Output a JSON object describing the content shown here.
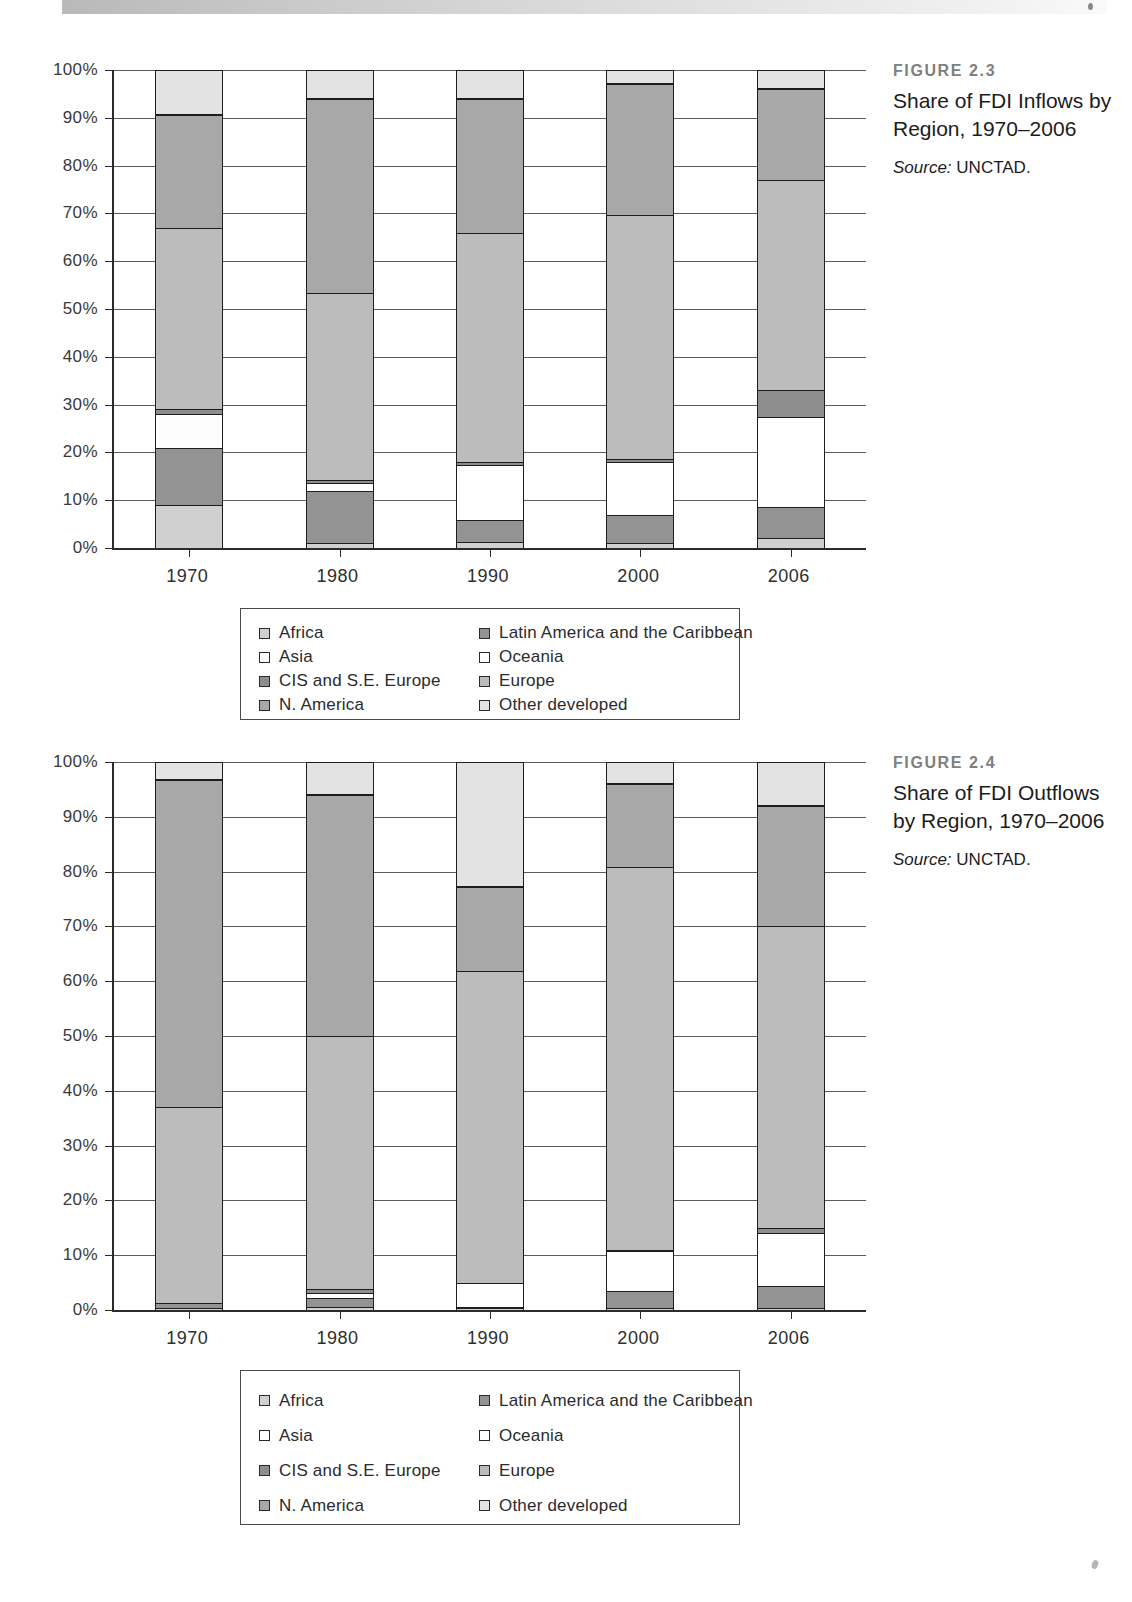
{
  "page": {
    "background": "#ffffff",
    "scan_artifact": true
  },
  "palette": {
    "africa": "#d0d0d0",
    "asia": "#ffffff",
    "cis": "#8d8d8d",
    "n_america": "#a8a8a8",
    "latin_america": "#939393",
    "oceania": "#fdfdfd",
    "europe": "#bcbcbc",
    "other_developed": "#e3e3e3",
    "outline": "#1d1d1d",
    "grid": "#5c5c5c",
    "axis": "#2b2b2b",
    "caption_num": "#7d8083"
  },
  "legend": {
    "columns": [
      [
        {
          "label": "Africa",
          "key": "africa"
        },
        {
          "label": "Asia",
          "key": "asia"
        },
        {
          "label": "CIS and S.E. Europe",
          "key": "cis"
        },
        {
          "label": "N. America",
          "key": "n_america"
        }
      ],
      [
        {
          "label": "Latin America and the Caribbean",
          "key": "latin_america"
        },
        {
          "label": "Oceania",
          "key": "oceania"
        },
        {
          "label": "Europe",
          "key": "europe"
        },
        {
          "label": "Other developed",
          "key": "other_developed"
        }
      ]
    ]
  },
  "figures": [
    {
      "id": "fig23",
      "number": "FIGURE 2.3",
      "title": "Share of FDI Inflows by Region, 1970–2006",
      "source_label": "Source:",
      "source_value": "UNCTAD."
    },
    {
      "id": "fig24",
      "number": "FIGURE 2.4",
      "title": "Share of FDI Outflows by Region, 1970–2006",
      "source_label": "Source:",
      "source_value": "UNCTAD."
    }
  ],
  "chart_data": [
    {
      "type": "bar",
      "stacked": true,
      "normalized": true,
      "title": "Share of FDI Inflows by Region, 1970–2006",
      "subtitle": "FIGURE 2.3",
      "source": "Source: UNCTAD.",
      "xlabel": "",
      "ylabel": "",
      "ylim": [
        0,
        100
      ],
      "ytick_labels": [
        "0%",
        "10%",
        "20%",
        "30%",
        "40%",
        "50%",
        "60%",
        "70%",
        "80%",
        "90%",
        "100%"
      ],
      "ytick_values": [
        0,
        10,
        20,
        30,
        40,
        50,
        60,
        70,
        80,
        90,
        100
      ],
      "grid": true,
      "legend_position": "bottom",
      "categories": [
        "1970",
        "1980",
        "1990",
        "2000",
        "2006"
      ],
      "series": [
        {
          "name": "Africa",
          "key": "africa",
          "values": [
            9.0,
            1.0,
            1.2,
            1.0,
            2.0
          ]
        },
        {
          "name": "Latin America and the Caribbean",
          "key": "latin_america",
          "values": [
            12.0,
            11.0,
            4.7,
            6.0,
            6.5
          ]
        },
        {
          "name": "Asia",
          "key": "asia",
          "values": [
            0.0,
            1.5,
            11.5,
            11.0,
            19.0
          ]
        },
        {
          "name": "Oceania",
          "key": "oceania",
          "values": [
            7.0,
            0.0,
            0.0,
            0.0,
            0.0
          ]
        },
        {
          "name": "CIS and S.E. Europe",
          "key": "cis",
          "values": [
            1.0,
            0.8,
            0.5,
            0.7,
            5.5
          ]
        },
        {
          "name": "Europe",
          "key": "europe",
          "values": [
            38.0,
            39.0,
            48.0,
            51.0,
            44.0
          ]
        },
        {
          "name": "N. America",
          "key": "n_america",
          "values": [
            23.5,
            40.7,
            28.1,
            27.3,
            19.0
          ]
        },
        {
          "name": "Other developed",
          "key": "other_developed",
          "values": [
            9.5,
            6.0,
            6.0,
            3.0,
            4.0
          ]
        }
      ],
      "stack_order": [
        "Africa",
        "Latin America and the Caribbean",
        "Asia",
        "Oceania",
        "CIS and S.E. Europe",
        "Europe",
        "N. America",
        "Other developed"
      ]
    },
    {
      "type": "bar",
      "stacked": true,
      "normalized": true,
      "title": "Share of FDI Outflows by Region, 1970–2006",
      "subtitle": "FIGURE 2.4",
      "source": "Source: UNCTAD.",
      "xlabel": "",
      "ylabel": "",
      "ylim": [
        0,
        100
      ],
      "ytick_labels": [
        "0%",
        "10%",
        "20%",
        "30%",
        "40%",
        "50%",
        "60%",
        "70%",
        "80%",
        "90%",
        "100%"
      ],
      "ytick_values": [
        0,
        10,
        20,
        30,
        40,
        50,
        60,
        70,
        80,
        90,
        100
      ],
      "grid": true,
      "legend_position": "bottom",
      "categories": [
        "1970",
        "1980",
        "1990",
        "2000",
        "2006"
      ],
      "series": [
        {
          "name": "Africa",
          "key": "africa",
          "values": [
            0.3,
            0.5,
            0.4,
            0.3,
            0.4
          ]
        },
        {
          "name": "Latin America and the Caribbean",
          "key": "latin_america",
          "values": [
            0.9,
            1.6,
            0.2,
            3.2,
            4.0
          ]
        },
        {
          "name": "Asia",
          "key": "asia",
          "values": [
            0.0,
            1.0,
            4.3,
            7.2,
            9.6
          ]
        },
        {
          "name": "Oceania",
          "key": "oceania",
          "values": [
            0.0,
            0.0,
            0.0,
            0.0,
            0.0
          ]
        },
        {
          "name": "CIS and S.E. Europe",
          "key": "cis",
          "values": [
            0.0,
            0.8,
            0.0,
            0.3,
            1.0
          ]
        },
        {
          "name": "Europe",
          "key": "europe",
          "values": [
            35.8,
            46.1,
            56.9,
            69.8,
            55.0
          ]
        },
        {
          "name": "N. America",
          "key": "n_america",
          "values": [
            59.7,
            43.9,
            15.4,
            15.2,
            22.0
          ]
        },
        {
          "name": "Other developed",
          "key": "other_developed",
          "values": [
            3.3,
            6.1,
            22.8,
            4.0,
            8.0
          ]
        }
      ],
      "stack_order": [
        "Africa",
        "Latin America and the Caribbean",
        "Asia",
        "Oceania",
        "CIS and S.E. Europe",
        "Europe",
        "N. America",
        "Other developed"
      ]
    }
  ]
}
